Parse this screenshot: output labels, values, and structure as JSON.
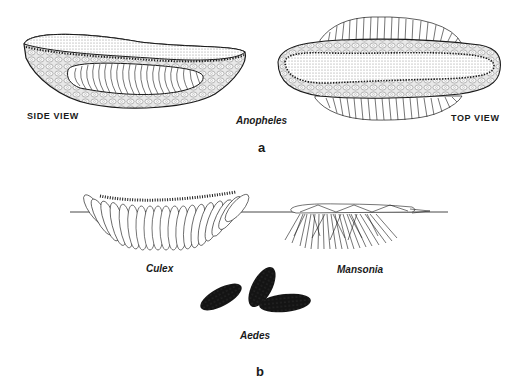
{
  "figure": {
    "panel_a": {
      "letter": "a",
      "genus": "Anopheles",
      "side_view_label": "SIDE VIEW",
      "top_view_label": "TOP VIEW"
    },
    "panel_b": {
      "letter": "b",
      "eggs": [
        {
          "genus": "Culex",
          "form": "egg raft on water surface"
        },
        {
          "genus": "Mansonia",
          "form": "egg cluster attached below water surface"
        },
        {
          "genus": "Aedes",
          "form": "single dark eggs"
        }
      ]
    },
    "colors": {
      "ink": "#1a1a1a",
      "stipple": "#d9d9d9",
      "float": "#bdbdbd",
      "aedes_egg": "#141414",
      "background": "#ffffff"
    }
  }
}
